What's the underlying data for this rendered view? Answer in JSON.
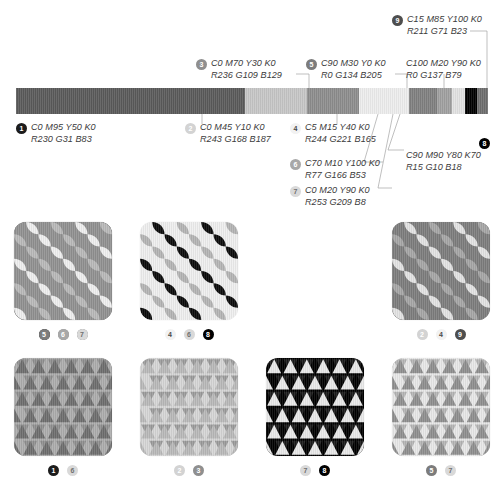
{
  "colorbar": {
    "segments": [
      {
        "id": "1",
        "hex": "#5a5a5a",
        "width_pct": 48.5
      },
      {
        "id": "2",
        "hex": "#c6c6c6",
        "width_pct": 13.2
      },
      {
        "id": "3",
        "hex": "#8d8d8d",
        "width_pct": 11.0
      },
      {
        "id": "4",
        "hex": "#ededed",
        "width_pct": 10.5
      },
      {
        "id": "5",
        "hex": "#808080",
        "width_pct": 6.0
      },
      {
        "id": "6",
        "hex": "#a0a0a0",
        "width_pct": 3.2
      },
      {
        "id": "7",
        "hex": "#e2e2e2",
        "width_pct": 2.8
      },
      {
        "id": "8",
        "hex": "#000000",
        "width_pct": 2.4
      },
      {
        "id": "9",
        "hex": "#6e6e6e",
        "width_pct": 2.4
      }
    ]
  },
  "callouts": [
    {
      "id": "1",
      "badge": "b1",
      "cmyk": "C0 M95 Y50 K0",
      "rgb": "R230 G31 B83"
    },
    {
      "id": "2",
      "badge": "b2",
      "cmyk": "C0 M45 Y10 K0",
      "rgb": "R243 G168 B187"
    },
    {
      "id": "3",
      "badge": "b3",
      "cmyk": "C0 M70 Y30 K0",
      "rgb": "R236 G109 B129"
    },
    {
      "id": "4",
      "badge": "b4",
      "cmyk": "C5 M15 Y40 K0",
      "rgb": "R244 G221 B165"
    },
    {
      "id": "5",
      "badge": "b5",
      "cmyk": "C90 M30 Y0 K0",
      "rgb": "R0 G134 B205"
    },
    {
      "id": "6",
      "badge": "b6",
      "cmyk": "C70 M10 Y100 K0",
      "rgb": "R77 G166 B53"
    },
    {
      "id": "7",
      "badge": "b7",
      "cmyk": "C0 M20 Y90 K0",
      "rgb": "R253 G209 B8"
    },
    {
      "id": "8",
      "badge": "b8",
      "cmyk": "C100 M20 Y90 K0",
      "rgb": "R0 G137 B79"
    },
    {
      "id": "9",
      "badge": "b9",
      "cmyk": "C15 M85 Y100 K0",
      "rgb": "R211 G71 B23"
    },
    {
      "id": "10",
      "badge": "b8",
      "cmyk": "C90 M90 Y80 K70",
      "rgb": "R15 G10 B18"
    }
  ],
  "swatches": [
    {
      "id": "swatch-1",
      "pattern": "petal",
      "bg": "#8a8a8a",
      "fg_a": "#6b6b6b",
      "fg_b": "#9e9e9e",
      "badges": [
        {
          "label": "1",
          "style": "b1"
        },
        {
          "label": "3",
          "style": "b3"
        },
        {
          "label": "5",
          "style": "b5"
        }
      ]
    },
    {
      "id": "swatch-2",
      "pattern": "petal",
      "bg": "#efefef",
      "fg_a": "#0b0b0b",
      "fg_b": "#b4b4b4",
      "badges": [
        {
          "label": "4",
          "style": "b4"
        },
        {
          "label": "6",
          "style": "b7"
        },
        {
          "label": "8",
          "style": "b8"
        }
      ]
    },
    {
      "id": "swatch-3",
      "pattern": "petal",
      "bg": "#919191",
      "fg_a": "#efefef",
      "fg_b": "#b9b9b9",
      "badges": [
        {
          "label": "5",
          "style": "b5"
        },
        {
          "label": "6",
          "style": "b6"
        },
        {
          "label": "7",
          "style": "b7"
        }
      ]
    },
    {
      "id": "swatch-4",
      "pattern": "petal",
      "bg": "#7d7d7d",
      "fg_a": "#e3e3e3",
      "fg_b": "#a6a6a6",
      "badges": [
        {
          "label": "2",
          "style": "b2"
        },
        {
          "label": "4",
          "style": "b4"
        },
        {
          "label": "9",
          "style": "b9"
        }
      ]
    },
    {
      "id": "swatch-5",
      "pattern": "triangle",
      "bg": "#6e6e6e",
      "fg_a": "#adadad",
      "fg_b": "#8f8f8f",
      "badges": [
        {
          "label": "1",
          "style": "b1"
        },
        {
          "label": "6",
          "style": "b7"
        }
      ]
    },
    {
      "id": "swatch-6",
      "pattern": "triangle",
      "bg": "#b9b9b9",
      "fg_a": "#d6d6d6",
      "fg_b": "#9b9b9b",
      "badges": [
        {
          "label": "2",
          "style": "b2"
        },
        {
          "label": "3",
          "style": "b3"
        }
      ]
    },
    {
      "id": "swatch-7",
      "pattern": "triangle",
      "bg": "#e9e9e9",
      "fg_a": "#000000",
      "fg_b": "#1a1a1a",
      "badges": [
        {
          "label": "7",
          "style": "b7"
        },
        {
          "label": "8",
          "style": "b8"
        }
      ]
    },
    {
      "id": "swatch-8",
      "pattern": "triangle",
      "bg": "#8f8f8f",
      "fg_a": "#e8e8e8",
      "fg_b": "#b5b5b5",
      "badges": [
        {
          "label": "5",
          "style": "b5"
        },
        {
          "label": "7",
          "style": "b7"
        }
      ]
    }
  ],
  "leader_color": "#9a9a9a"
}
